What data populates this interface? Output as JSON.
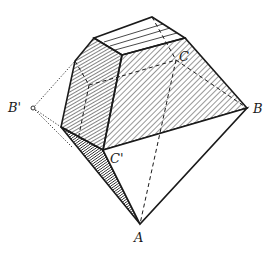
{
  "diagram": {
    "type": "crystal-polyhedron",
    "labels": {
      "A": "A",
      "B": "B",
      "C": "C",
      "B_prime": "B'",
      "C_prime": "C'"
    },
    "colors": {
      "line": "#1a1a1a",
      "background": "#ffffff"
    }
  }
}
